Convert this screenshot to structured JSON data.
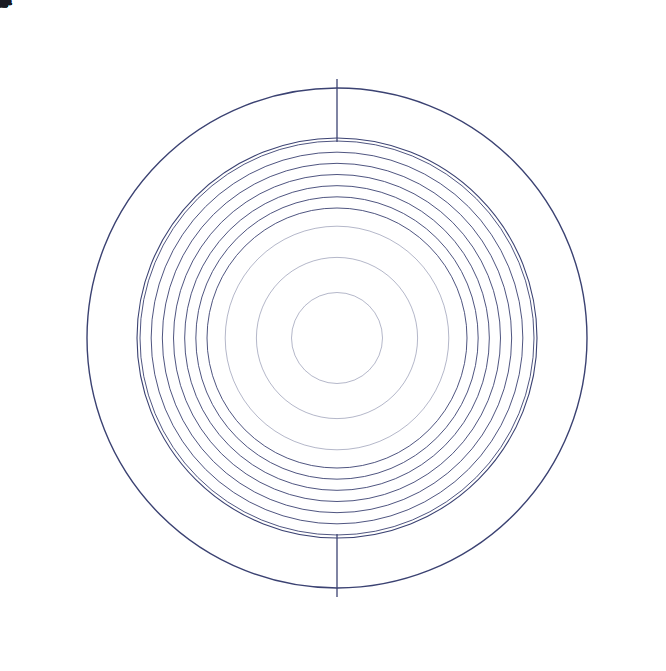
{
  "colors": {
    "yang_fill": "#2c3269",
    "line_stroke": "#3b4272",
    "label_text": "#1a1a22",
    "background": "#ffffff"
  },
  "geometry": {
    "center_x": 337,
    "center_y": 338,
    "outer_circle_radius": 253,
    "hexagram_band_outer": 250,
    "hexagram_band_inner": 200,
    "cell_rings_outer": 197,
    "cell_rings_inner": 130,
    "ring_count": 6,
    "sector_count": 64,
    "spoke_count": 64,
    "label_radius": 272
  },
  "chart_data": {
    "type": "pie",
    "legend": "none",
    "grid": true,
    "categories": [
      "乾",
      "姤",
      "遁",
      "否",
      "观",
      "剥",
      "坤",
      "复",
      "大过",
      "鼎",
      "恒",
      "巽",
      "井",
      "蛊",
      "升",
      "讼",
      "困",
      "未济",
      "解",
      "涣",
      "坤",
      "蒙",
      "师",
      "遁",
      "咸",
      "旅",
      "小过",
      "渐",
      "蹇",
      "艮",
      "谦",
      "否",
      "萃",
      "晋",
      "豫",
      "观",
      "比",
      "剥",
      "复",
      "频",
      "屯",
      "益",
      "震",
      "噬嗑",
      "无妄",
      "随",
      "明夷",
      "贲",
      "既济",
      "家人",
      "丰",
      "革",
      "离",
      "同人",
      "临",
      "损",
      "节",
      "中孚",
      "归妹",
      "睽",
      "兑",
      "履",
      "泰",
      "大畜"
    ],
    "values": [
      1,
      1,
      1,
      1,
      1,
      1,
      1,
      1,
      1,
      1,
      1,
      1,
      1,
      1,
      1,
      1,
      1,
      1,
      1,
      1,
      1,
      1,
      1,
      1,
      1,
      1,
      1,
      1,
      1,
      1,
      1,
      1,
      1,
      1,
      1,
      1,
      1,
      1,
      1,
      1,
      1,
      1,
      1,
      1,
      1,
      1,
      1,
      1,
      1,
      1,
      1,
      1,
      1,
      1,
      1,
      1,
      1,
      1,
      1,
      1,
      1,
      1,
      1,
      1
    ],
    "xlabel": "",
    "ylabel": ""
  },
  "diagram": {
    "start_angle_deg": -90,
    "direction": "clockwise",
    "sectors": [
      {
        "index": 0,
        "name": "乾",
        "binary": "111111"
      },
      {
        "index": 1,
        "name": "姤",
        "binary": "111110"
      },
      {
        "index": 2,
        "name": "大过",
        "binary": "111101"
      },
      {
        "index": 3,
        "name": "鼎",
        "binary": "111100"
      },
      {
        "index": 4,
        "name": "恒",
        "binary": "111011"
      },
      {
        "index": 5,
        "name": "巽",
        "binary": "111010"
      },
      {
        "index": 6,
        "name": "井",
        "binary": "111001"
      },
      {
        "index": 7,
        "name": "蛊",
        "binary": "111000"
      },
      {
        "index": 8,
        "name": "升",
        "binary": "110111"
      },
      {
        "index": 9,
        "name": "讼",
        "binary": "110110"
      },
      {
        "index": 10,
        "name": "困",
        "binary": "110101"
      },
      {
        "index": 11,
        "name": "未济",
        "binary": "110100"
      },
      {
        "index": 12,
        "name": "解",
        "binary": "110011"
      },
      {
        "index": 13,
        "name": "涣",
        "binary": "110010"
      },
      {
        "index": 14,
        "name": "坎",
        "binary": "110001"
      },
      {
        "index": 15,
        "name": "蒙",
        "binary": "110000"
      },
      {
        "index": 16,
        "name": "师",
        "binary": "101111"
      },
      {
        "index": 17,
        "name": "遁",
        "binary": "101110"
      },
      {
        "index": 18,
        "name": "咸",
        "binary": "101101"
      },
      {
        "index": 19,
        "name": "旅",
        "binary": "101100"
      },
      {
        "index": 20,
        "name": "小过",
        "binary": "101011"
      },
      {
        "index": 21,
        "name": "渐",
        "binary": "101010"
      },
      {
        "index": 22,
        "name": "蹇",
        "binary": "101001"
      },
      {
        "index": 23,
        "name": "艮",
        "binary": "101000"
      },
      {
        "index": 24,
        "name": "谦",
        "binary": "100111"
      },
      {
        "index": 25,
        "name": "否",
        "binary": "100110"
      },
      {
        "index": 26,
        "name": "萃",
        "binary": "100101"
      },
      {
        "index": 27,
        "name": "晋",
        "binary": "100100"
      },
      {
        "index": 28,
        "name": "豫",
        "binary": "100011"
      },
      {
        "index": 29,
        "name": "观",
        "binary": "100010"
      },
      {
        "index": 30,
        "name": "比",
        "binary": "100001"
      },
      {
        "index": 31,
        "name": "剥",
        "binary": "100000"
      },
      {
        "index": 32,
        "name": "坤",
        "binary": "000000"
      },
      {
        "index": 33,
        "name": "复",
        "binary": "000001"
      },
      {
        "index": 34,
        "name": "频",
        "binary": "000010"
      },
      {
        "index": 35,
        "name": "屯",
        "binary": "000011"
      },
      {
        "index": 36,
        "name": "益",
        "binary": "000100"
      },
      {
        "index": 37,
        "name": "震",
        "binary": "000101"
      },
      {
        "index": 38,
        "name": "噬嗑",
        "binary": "000110"
      },
      {
        "index": 39,
        "name": "无妄",
        "binary": "000111"
      },
      {
        "index": 40,
        "name": "随",
        "binary": "001000"
      },
      {
        "index": 41,
        "name": "明夷",
        "binary": "001001"
      },
      {
        "index": 42,
        "name": "贲",
        "binary": "001010"
      },
      {
        "index": 43,
        "name": "既济",
        "binary": "001011"
      },
      {
        "index": 44,
        "name": "家人",
        "binary": "001100"
      },
      {
        "index": 45,
        "name": "丰",
        "binary": "001101"
      },
      {
        "index": 46,
        "name": "革",
        "binary": "001110"
      },
      {
        "index": 47,
        "name": "离",
        "binary": "001111"
      },
      {
        "index": 48,
        "name": "同人",
        "binary": "010000"
      },
      {
        "index": 49,
        "name": "临",
        "binary": "010001"
      },
      {
        "index": 50,
        "name": "损",
        "binary": "010010"
      },
      {
        "index": 51,
        "name": "节",
        "binary": "010011"
      },
      {
        "index": 52,
        "name": "中孚",
        "binary": "010100"
      },
      {
        "index": 53,
        "name": "归妹",
        "binary": "010101"
      },
      {
        "index": 54,
        "name": "睽",
        "binary": "010110"
      },
      {
        "index": 55,
        "name": "兑",
        "binary": "010111"
      },
      {
        "index": 56,
        "name": "履",
        "binary": "011000"
      },
      {
        "index": 57,
        "name": "泰",
        "binary": "011001"
      },
      {
        "index": 58,
        "name": "大畜",
        "binary": "011010"
      },
      {
        "index": 59,
        "name": "需",
        "binary": "011011"
      },
      {
        "index": 60,
        "name": "小畜",
        "binary": "011100"
      },
      {
        "index": 61,
        "name": "大壮",
        "binary": "011101"
      },
      {
        "index": 62,
        "name": "大有",
        "binary": "011110"
      },
      {
        "index": 63,
        "name": "夬",
        "binary": "011111"
      }
    ]
  }
}
